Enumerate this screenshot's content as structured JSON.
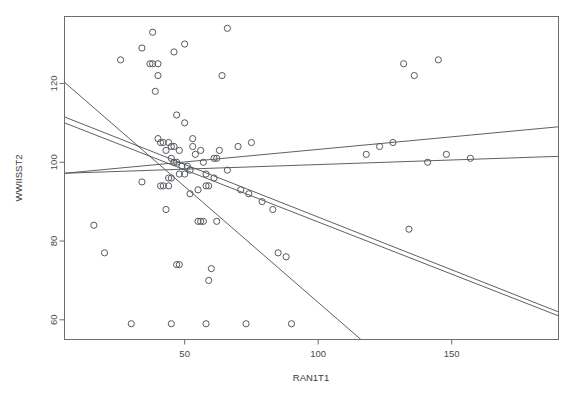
{
  "chart_data": {
    "type": "scatter",
    "title": "",
    "xlabel": "RAN1T1",
    "ylabel": "WWIISST2",
    "xlim": [
      5,
      190
    ],
    "ylim": [
      55,
      137
    ],
    "grid": false,
    "legend": null,
    "xticks": [
      50,
      100,
      150
    ],
    "yticks": [
      60,
      80,
      100,
      120
    ],
    "xtick_labels": [
      "50",
      "100",
      "150"
    ],
    "ytick_labels": [
      "60",
      "80",
      "100",
      "120"
    ],
    "points": [
      [
        38,
        133
      ],
      [
        34,
        129
      ],
      [
        26,
        126
      ],
      [
        46,
        128
      ],
      [
        50,
        130
      ],
      [
        37,
        125
      ],
      [
        38,
        125
      ],
      [
        40,
        125
      ],
      [
        66,
        134
      ],
      [
        40,
        122
      ],
      [
        64,
        122
      ],
      [
        39,
        118
      ],
      [
        47,
        112
      ],
      [
        50,
        110
      ],
      [
        53,
        106
      ],
      [
        53,
        104
      ],
      [
        40,
        106
      ],
      [
        41,
        105
      ],
      [
        42,
        105
      ],
      [
        44,
        105
      ],
      [
        45,
        104
      ],
      [
        46,
        104
      ],
      [
        43,
        103
      ],
      [
        48,
        103
      ],
      [
        54,
        102
      ],
      [
        56,
        103
      ],
      [
        61,
        101
      ],
      [
        62,
        101
      ],
      [
        63,
        103
      ],
      [
        70,
        104
      ],
      [
        75,
        105
      ],
      [
        45,
        101
      ],
      [
        46,
        100
      ],
      [
        47,
        100
      ],
      [
        49,
        99
      ],
      [
        51,
        99
      ],
      [
        57,
        100
      ],
      [
        52,
        98
      ],
      [
        48,
        97
      ],
      [
        50,
        97
      ],
      [
        44,
        96
      ],
      [
        45,
        96
      ],
      [
        58,
        97
      ],
      [
        61,
        96
      ],
      [
        66,
        98
      ],
      [
        34,
        95
      ],
      [
        41,
        94
      ],
      [
        42,
        94
      ],
      [
        44,
        94
      ],
      [
        58,
        94
      ],
      [
        59,
        94
      ],
      [
        55,
        93
      ],
      [
        52,
        92
      ],
      [
        71,
        93
      ],
      [
        74,
        92
      ],
      [
        79,
        90
      ],
      [
        83,
        88
      ],
      [
        43,
        88
      ],
      [
        16,
        84
      ],
      [
        55,
        85
      ],
      [
        56,
        85
      ],
      [
        57,
        85
      ],
      [
        62,
        85
      ],
      [
        20,
        77
      ],
      [
        47,
        74
      ],
      [
        48,
        74
      ],
      [
        60,
        73
      ],
      [
        85,
        77
      ],
      [
        88,
        76
      ],
      [
        59,
        70
      ],
      [
        30,
        59
      ],
      [
        45,
        59
      ],
      [
        58,
        59
      ],
      [
        73,
        59
      ],
      [
        90,
        59
      ],
      [
        132,
        125
      ],
      [
        136,
        122
      ],
      [
        123,
        104
      ],
      [
        128,
        105
      ],
      [
        118,
        102
      ],
      [
        141,
        100
      ],
      [
        148,
        102
      ],
      [
        134,
        83
      ],
      [
        145,
        126
      ],
      [
        157,
        101
      ]
    ],
    "regression_lines": [
      {
        "name": "line-1-steep-negative",
        "x1": 5,
        "y1": 120.3,
        "x2": 116,
        "y2": 55.0
      },
      {
        "name": "line-2-negative-mid",
        "x1": 5,
        "y1": 111.5,
        "x2": 190,
        "y2": 62.0
      },
      {
        "name": "line-3-negative-lower",
        "x1": 5,
        "y1": 110.0,
        "x2": 190,
        "y2": 61.0
      },
      {
        "name": "line-4-positive",
        "x1": 5,
        "y1": 97.2,
        "x2": 190,
        "y2": 109.0
      },
      {
        "name": "line-5-positive-flat",
        "x1": 5,
        "y1": 97.2,
        "x2": 190,
        "y2": 101.5
      }
    ]
  }
}
